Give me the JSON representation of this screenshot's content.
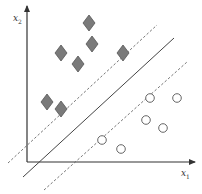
{
  "diagram": {
    "axes": {
      "x_label": "x",
      "x_sub": "1",
      "y_label": "x",
      "y_sub": "2"
    },
    "colors": {
      "axis": "#333333",
      "diamond_fill": "#7a7a7a",
      "diamond_stroke": "#555555",
      "circle_stroke": "#555555",
      "hyperplane": "#444444",
      "margin": "#666666"
    },
    "class_a_diamonds": [
      {
        "x": 89,
        "y": 23
      },
      {
        "x": 92,
        "y": 44
      },
      {
        "x": 61,
        "y": 53
      },
      {
        "x": 78,
        "y": 64
      },
      {
        "x": 123,
        "y": 53
      },
      {
        "x": 47,
        "y": 102
      },
      {
        "x": 61,
        "y": 109
      }
    ],
    "class_b_circles": [
      {
        "x": 150,
        "y": 98
      },
      {
        "x": 177,
        "y": 98
      },
      {
        "x": 146,
        "y": 120
      },
      {
        "x": 163,
        "y": 128
      },
      {
        "x": 102,
        "y": 140
      },
      {
        "x": 121,
        "y": 149
      }
    ],
    "lines": {
      "hyperplane": {
        "x1": 23,
        "y1": 177,
        "x2": 174,
        "y2": 38
      },
      "margin_upper": {
        "x1": 8,
        "y1": 163,
        "x2": 157,
        "y2": 25
      },
      "margin_lower": {
        "x1": 44,
        "y1": 190,
        "x2": 187,
        "y2": 62
      }
    }
  }
}
